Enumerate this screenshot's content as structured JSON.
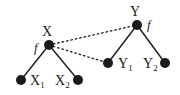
{
  "diagram": {
    "type": "tree-mapping",
    "colors": {
      "ink": "#1a1a1a",
      "background": "#ffffff"
    },
    "trees": [
      {
        "root": {
          "label": "X",
          "function_label": "f",
          "x": 49,
          "y": 45
        },
        "children": [
          {
            "label": "X",
            "subscript": "1",
            "x": 21,
            "y": 80
          },
          {
            "label": "X",
            "subscript": "2",
            "x": 78,
            "y": 80
          }
        ]
      },
      {
        "root": {
          "label": "Y",
          "function_label": "f",
          "x": 137,
          "y": 25
        },
        "children": [
          {
            "label": "Y",
            "subscript": "1",
            "x": 108,
            "y": 63
          },
          {
            "label": "Y",
            "subscript": "2",
            "x": 165,
            "y": 63
          }
        ]
      }
    ],
    "dotted_links": [
      {
        "from": "X",
        "to": "Y"
      },
      {
        "from": "X",
        "to": "Y1"
      }
    ]
  }
}
